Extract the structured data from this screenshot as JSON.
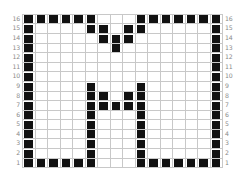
{
  "widget": {
    "name": "bitmap-grid-editor",
    "columns": 16,
    "rows": 16,
    "cell_on_color": "#111111",
    "cell_off_color": "#ffffff",
    "gridline_color": "#c8c8c8",
    "label_color": "#8a8a8a",
    "background_color": "#ffffff"
  },
  "row_labels_left": [
    "16",
    "15",
    "14",
    "13",
    "12",
    "11",
    "10",
    "9",
    "8",
    "7",
    "6",
    "5",
    "4",
    "3",
    "2",
    "1"
  ],
  "row_labels_right": [
    "16",
    "15",
    "14",
    "13",
    "12",
    "11",
    "10",
    "9",
    "8",
    "7",
    "6",
    "5",
    "4",
    "3",
    "2",
    "1"
  ],
  "chart_data": {
    "type": "heatmap",
    "title": "",
    "xlabel": "",
    "ylabel": "",
    "grid": true,
    "legend": "none",
    "x": [
      1,
      2,
      3,
      4,
      5,
      6,
      7,
      8,
      9,
      10,
      11,
      12,
      13,
      14,
      15,
      16
    ],
    "y": [
      16,
      15,
      14,
      13,
      12,
      11,
      10,
      9,
      8,
      7,
      6,
      5,
      4,
      3,
      2,
      1
    ],
    "note": "Each inner array is one grid row, listed top (row 16) to bottom (row 1); 1 = filled black cell, 0 = empty white cell.",
    "values": [
      [
        1,
        1,
        1,
        1,
        1,
        1,
        0,
        0,
        0,
        1,
        1,
        1,
        1,
        1,
        1,
        1
      ],
      [
        1,
        0,
        0,
        0,
        0,
        1,
        1,
        0,
        1,
        1,
        0,
        0,
        0,
        0,
        0,
        1
      ],
      [
        1,
        0,
        0,
        0,
        0,
        0,
        1,
        1,
        1,
        0,
        0,
        0,
        0,
        0,
        0,
        1
      ],
      [
        1,
        0,
        0,
        0,
        0,
        0,
        0,
        1,
        0,
        0,
        0,
        0,
        0,
        0,
        0,
        1
      ],
      [
        1,
        0,
        0,
        0,
        0,
        0,
        0,
        0,
        0,
        0,
        0,
        0,
        0,
        0,
        0,
        1
      ],
      [
        1,
        0,
        0,
        0,
        0,
        0,
        0,
        0,
        0,
        0,
        0,
        0,
        0,
        0,
        0,
        1
      ],
      [
        1,
        0,
        0,
        0,
        0,
        0,
        0,
        0,
        0,
        0,
        0,
        0,
        0,
        0,
        0,
        1
      ],
      [
        1,
        0,
        0,
        0,
        0,
        1,
        0,
        0,
        0,
        1,
        0,
        0,
        0,
        0,
        0,
        1
      ],
      [
        1,
        0,
        0,
        0,
        0,
        1,
        1,
        0,
        1,
        1,
        0,
        0,
        0,
        0,
        0,
        1
      ],
      [
        1,
        0,
        0,
        0,
        0,
        1,
        1,
        1,
        1,
        1,
        0,
        0,
        0,
        0,
        0,
        1
      ],
      [
        1,
        0,
        0,
        0,
        0,
        1,
        0,
        0,
        0,
        1,
        0,
        0,
        0,
        0,
        0,
        1
      ],
      [
        1,
        0,
        0,
        0,
        0,
        1,
        0,
        0,
        0,
        1,
        0,
        0,
        0,
        0,
        0,
        1
      ],
      [
        1,
        0,
        0,
        0,
        0,
        1,
        0,
        0,
        0,
        1,
        0,
        0,
        0,
        0,
        0,
        1
      ],
      [
        1,
        0,
        0,
        0,
        0,
        1,
        0,
        0,
        0,
        1,
        0,
        0,
        0,
        0,
        0,
        1
      ],
      [
        1,
        0,
        0,
        0,
        0,
        1,
        0,
        0,
        0,
        1,
        0,
        0,
        0,
        0,
        0,
        1
      ],
      [
        1,
        1,
        1,
        1,
        1,
        1,
        0,
        0,
        0,
        1,
        1,
        1,
        1,
        1,
        1,
        1
      ]
    ]
  }
}
